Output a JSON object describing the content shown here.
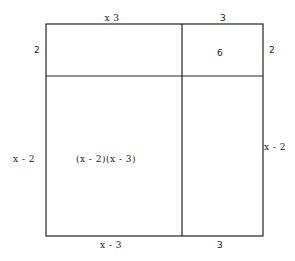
{
  "diagram": {
    "type": "area-model",
    "top_labels": {
      "left": "x  3",
      "right": "3"
    },
    "bottom_labels": {
      "left": "x - 3",
      "right": "3"
    },
    "left_labels": {
      "top": "2",
      "bottom": "x - 2"
    },
    "right_labels": {
      "top": "2",
      "bottom": "x - 2"
    },
    "regions": {
      "top_left": "",
      "top_right": "6",
      "bottom_left": "(x - 2)(x - 3)",
      "bottom_right": ""
    },
    "line_color": "#222222"
  }
}
